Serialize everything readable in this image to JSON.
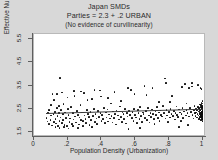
{
  "figure": {
    "title_lines": [
      "Japan SMDs",
      "Parties = 2.3 + .2 URBAN",
      "(No evidence of curvilinearity)"
    ],
    "background_color": "#d8d8d8",
    "plot_background_color": "#ffffff",
    "marker_color": "#0a0a0a",
    "fit_line_color": "#3a3a3a"
  },
  "chart_data": {
    "type": "scatter",
    "title": "Japan SMDs",
    "subtitle": "Parties = 2.3 + .2 URBAN",
    "annotation": "(No evidence of curvilinearity)",
    "xlabel": "Population Density (Urbanization)",
    "ylabel": "Effective Number of Parties",
    "xlim": [
      0,
      1.02
    ],
    "ylim": [
      1.28,
      5.72
    ],
    "xticks": [
      0,
      0.2,
      0.4,
      0.6,
      0.8,
      1
    ],
    "xticklabels": [
      "0",
      ".2",
      ".4",
      ".6",
      ".8",
      "1"
    ],
    "yticks": [
      1.5,
      2.5,
      3.5,
      4.5,
      5.5
    ],
    "yticklabels": [
      "1.5",
      "2.5",
      "3.5",
      "4.5",
      "5.5"
    ],
    "grid": false,
    "legend": null,
    "fit": {
      "type": "linear",
      "intercept": 2.3,
      "slope": 0.2,
      "x_start": 0.07,
      "x_end": 1.0,
      "y_start": 2.314,
      "y_end": 2.5
    },
    "points": [
      [
        0.075,
        2.11
      ],
      [
        0.08,
        1.95
      ],
      [
        0.085,
        2.3
      ],
      [
        0.09,
        1.83
      ],
      [
        0.092,
        2.42
      ],
      [
        0.098,
        2.02
      ],
      [
        0.1,
        2.21
      ],
      [
        0.105,
        1.78
      ],
      [
        0.11,
        3.12
      ],
      [
        0.115,
        2.28
      ],
      [
        0.12,
        1.92
      ],
      [
        0.125,
        2.36
      ],
      [
        0.128,
        2.05
      ],
      [
        0.13,
        1.86
      ],
      [
        0.135,
        2.52
      ],
      [
        0.14,
        2.18
      ],
      [
        0.142,
        1.74
      ],
      [
        0.148,
        2.3
      ],
      [
        0.15,
        2.62
      ],
      [
        0.152,
        1.98
      ],
      [
        0.155,
        3.82
      ],
      [
        0.158,
        2.12
      ],
      [
        0.16,
        2.44
      ],
      [
        0.165,
        1.88
      ],
      [
        0.17,
        2.26
      ],
      [
        0.172,
        2.02
      ],
      [
        0.175,
        2.7
      ],
      [
        0.18,
        1.8
      ],
      [
        0.185,
        2.34
      ],
      [
        0.19,
        2.1
      ],
      [
        0.195,
        1.76
      ],
      [
        0.2,
        2.48
      ],
      [
        0.205,
        2.22
      ],
      [
        0.21,
        1.94
      ],
      [
        0.215,
        2.08
      ],
      [
        0.22,
        2.58
      ],
      [
        0.225,
        1.85
      ],
      [
        0.23,
        2.32
      ],
      [
        0.235,
        2.04
      ],
      [
        0.24,
        3.05
      ],
      [
        0.245,
        2.16
      ],
      [
        0.25,
        1.9
      ],
      [
        0.255,
        2.4
      ],
      [
        0.26,
        2.24
      ],
      [
        0.265,
        1.82
      ],
      [
        0.27,
        2.12
      ],
      [
        0.275,
        2.66
      ],
      [
        0.28,
        2.0
      ],
      [
        0.285,
        2.34
      ],
      [
        0.29,
        1.96
      ],
      [
        0.295,
        3.18
      ],
      [
        0.3,
        2.2
      ],
      [
        0.305,
        2.06
      ],
      [
        0.31,
        1.88
      ],
      [
        0.315,
        2.44
      ],
      [
        0.32,
        2.28
      ],
      [
        0.325,
        2.14
      ],
      [
        0.33,
        1.79
      ],
      [
        0.335,
        2.36
      ],
      [
        0.34,
        2.02
      ],
      [
        0.345,
        2.92
      ],
      [
        0.35,
        2.18
      ],
      [
        0.355,
        2.5
      ],
      [
        0.36,
        1.93
      ],
      [
        0.365,
        2.26
      ],
      [
        0.37,
        2.08
      ],
      [
        0.375,
        1.84
      ],
      [
        0.38,
        2.4
      ],
      [
        0.385,
        2.15
      ],
      [
        0.39,
        3.28
      ],
      [
        0.395,
        2.3
      ],
      [
        0.4,
        1.98
      ],
      [
        0.405,
        2.22
      ],
      [
        0.41,
        2.05
      ],
      [
        0.415,
        2.54
      ],
      [
        0.42,
        1.87
      ],
      [
        0.425,
        2.33
      ],
      [
        0.43,
        2.12
      ],
      [
        0.435,
        2.46
      ],
      [
        0.44,
        1.95
      ],
      [
        0.445,
        2.25
      ],
      [
        0.45,
        2.08
      ],
      [
        0.455,
        2.72
      ],
      [
        0.46,
        2.18
      ],
      [
        0.465,
        1.9
      ],
      [
        0.47,
        2.38
      ],
      [
        0.475,
        2.1
      ],
      [
        0.48,
        2.28
      ],
      [
        0.485,
        1.82
      ],
      [
        0.49,
        2.42
      ],
      [
        0.5,
        2.2
      ],
      [
        0.505,
        2.04
      ],
      [
        0.51,
        2.6
      ],
      [
        0.515,
        2.14
      ],
      [
        0.52,
        1.92
      ],
      [
        0.525,
        2.34
      ],
      [
        0.53,
        2.26
      ],
      [
        0.535,
        2.06
      ],
      [
        0.54,
        2.48
      ],
      [
        0.545,
        1.86
      ],
      [
        0.55,
        2.3
      ],
      [
        0.555,
        2.16
      ],
      [
        0.56,
        1.62
      ],
      [
        0.565,
        2.4
      ],
      [
        0.57,
        2.22
      ],
      [
        0.575,
        3.32
      ],
      [
        0.58,
        2.09
      ],
      [
        0.585,
        2.36
      ],
      [
        0.59,
        1.96
      ],
      [
        0.595,
        2.5
      ],
      [
        0.6,
        2.24
      ],
      [
        0.605,
        2.12
      ],
      [
        0.61,
        1.88
      ],
      [
        0.615,
        2.44
      ],
      [
        0.62,
        2.3
      ],
      [
        0.625,
        2.06
      ],
      [
        0.63,
        2.58
      ],
      [
        0.635,
        2.18
      ],
      [
        0.64,
        1.94
      ],
      [
        0.645,
        2.34
      ],
      [
        0.65,
        2.26
      ],
      [
        0.655,
        3.48
      ],
      [
        0.66,
        2.1
      ],
      [
        0.665,
        2.4
      ],
      [
        0.67,
        2.02
      ],
      [
        0.675,
        2.52
      ],
      [
        0.68,
        2.2
      ],
      [
        0.685,
        1.9
      ],
      [
        0.69,
        2.32
      ],
      [
        0.695,
        2.14
      ],
      [
        0.7,
        2.46
      ],
      [
        0.705,
        2.28
      ],
      [
        0.71,
        2.06
      ],
      [
        0.715,
        1.84
      ],
      [
        0.72,
        2.38
      ],
      [
        0.725,
        2.22
      ],
      [
        0.73,
        2.56
      ],
      [
        0.735,
        2.1
      ],
      [
        0.74,
        2.34
      ],
      [
        0.745,
        1.98
      ],
      [
        0.75,
        2.42
      ],
      [
        0.755,
        2.24
      ],
      [
        0.76,
        2.16
      ],
      [
        0.765,
        2.62
      ],
      [
        0.77,
        2.3
      ],
      [
        0.775,
        3.8
      ],
      [
        0.78,
        2.08
      ],
      [
        0.785,
        2.44
      ],
      [
        0.79,
        2.2
      ],
      [
        0.795,
        1.92
      ],
      [
        0.8,
        2.36
      ],
      [
        0.805,
        2.12
      ],
      [
        0.81,
        2.5
      ],
      [
        0.815,
        2.28
      ],
      [
        0.82,
        3.06
      ],
      [
        0.825,
        2.18
      ],
      [
        0.83,
        2.4
      ],
      [
        0.835,
        2.04
      ],
      [
        0.84,
        2.32
      ],
      [
        0.845,
        2.6
      ],
      [
        0.85,
        2.22
      ],
      [
        0.855,
        2.14
      ],
      [
        0.86,
        2.46
      ],
      [
        0.865,
        2.34
      ],
      [
        0.87,
        1.96
      ],
      [
        0.875,
        2.26
      ],
      [
        0.88,
        2.54
      ],
      [
        0.885,
        2.1
      ],
      [
        0.89,
        2.38
      ],
      [
        0.895,
        3.56
      ],
      [
        0.9,
        2.2
      ],
      [
        0.905,
        2.44
      ],
      [
        0.91,
        2.3
      ],
      [
        0.915,
        1.8
      ],
      [
        0.92,
        2.16
      ],
      [
        0.925,
        2.52
      ],
      [
        0.93,
        2.36
      ],
      [
        0.935,
        3.46
      ],
      [
        0.94,
        2.24
      ],
      [
        0.945,
        2.08
      ],
      [
        0.95,
        2.42
      ],
      [
        0.952,
        2.62
      ],
      [
        0.955,
        2.3
      ],
      [
        0.958,
        2.18
      ],
      [
        0.96,
        2.5
      ],
      [
        0.962,
        2.34
      ],
      [
        0.965,
        2.12
      ],
      [
        0.968,
        2.44
      ],
      [
        0.97,
        2.26
      ],
      [
        0.972,
        3.52
      ],
      [
        0.974,
        2.56
      ],
      [
        0.976,
        2.2
      ],
      [
        0.978,
        2.38
      ],
      [
        0.98,
        2.06
      ],
      [
        0.982,
        2.48
      ],
      [
        0.984,
        2.3
      ],
      [
        0.985,
        2.68
      ],
      [
        0.986,
        2.14
      ],
      [
        0.987,
        2.42
      ],
      [
        0.988,
        2.24
      ],
      [
        0.989,
        2.58
      ],
      [
        0.99,
        2.34
      ],
      [
        0.991,
        2.02
      ],
      [
        0.992,
        2.46
      ],
      [
        0.993,
        2.22
      ],
      [
        0.994,
        2.76
      ],
      [
        0.995,
        2.3
      ],
      [
        0.996,
        2.1
      ],
      [
        0.996,
        2.52
      ],
      [
        0.997,
        2.38
      ],
      [
        0.997,
        2.18
      ],
      [
        0.998,
        2.64
      ],
      [
        0.998,
        2.28
      ],
      [
        0.999,
        2.44
      ],
      [
        0.999,
        2.06
      ],
      [
        1.0,
        2.34
      ],
      [
        1.0,
        2.2
      ],
      [
        1.0,
        2.56
      ],
      [
        1.0,
        2.12
      ],
      [
        1.0,
        2.48
      ],
      [
        1.0,
        2.26
      ],
      [
        1.0,
        2.72
      ],
      [
        1.0,
        2.4
      ],
      [
        1.0,
        1.98
      ],
      [
        1.0,
        2.3
      ],
      [
        0.999,
        2.84
      ],
      [
        0.998,
        2.16
      ],
      [
        0.997,
        2.6
      ],
      [
        0.996,
        2.36
      ],
      [
        0.995,
        2.04
      ],
      [
        0.994,
        3.34
      ],
      [
        0.993,
        2.5
      ],
      [
        0.992,
        2.24
      ],
      [
        0.991,
        2.66
      ],
      [
        0.99,
        2.14
      ],
      [
        0.988,
        3.38
      ],
      [
        0.986,
        2.42
      ],
      [
        0.984,
        2.28
      ],
      [
        0.982,
        2.08
      ],
      [
        0.98,
        2.54
      ],
      [
        0.938,
        3.6
      ],
      [
        0.918,
        3.4
      ],
      [
        0.905,
        2.72
      ],
      [
        0.878,
        3.44
      ],
      [
        0.858,
        1.72
      ],
      [
        0.805,
        2.8
      ],
      [
        0.782,
        3.62
      ],
      [
        0.742,
        2.78
      ],
      [
        0.702,
        3.38
      ],
      [
        0.668,
        3.1
      ],
      [
        0.628,
        1.66
      ],
      [
        0.596,
        3.14
      ],
      [
        0.556,
        3.4
      ],
      [
        0.516,
        2.84
      ],
      [
        0.478,
        3.22
      ],
      [
        0.438,
        2.96
      ],
      [
        0.398,
        3.02
      ],
      [
        0.358,
        3.3
      ],
      [
        0.318,
        2.88
      ],
      [
        0.278,
        3.24
      ],
      [
        0.238,
        3.26
      ],
      [
        0.198,
        2.98
      ],
      [
        0.168,
        3.2
      ],
      [
        0.138,
        3.14
      ],
      [
        0.118,
        2.88
      ],
      [
        0.102,
        2.66
      ],
      [
        0.088,
        2.44
      ],
      [
        0.262,
        1.68
      ],
      [
        0.342,
        1.7
      ],
      [
        0.205,
        1.64
      ],
      [
        0.152,
        1.66
      ],
      [
        0.128,
        1.7
      ],
      [
        0.178,
        1.72
      ],
      [
        0.232,
        1.74
      ],
      [
        0.292,
        1.76
      ]
    ]
  }
}
